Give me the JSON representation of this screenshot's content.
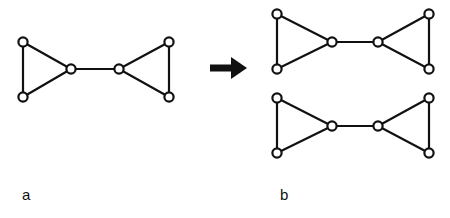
{
  "figure": {
    "width": 450,
    "height": 218,
    "background": "#ffffff",
    "stroke_color": "#111111",
    "node_fill": "#ffffff",
    "panels": [
      {
        "id": "a",
        "label": "a",
        "label_x": 22,
        "label_y": 200,
        "caption": "bowtie graph before split"
      },
      {
        "id": "b",
        "label": "b",
        "label_x": 280,
        "label_y": 200,
        "caption": "two bowtie graphs after split"
      }
    ],
    "arrow": {
      "name": "rightwards-arrow",
      "shaft_x1": 210,
      "shaft_x2": 233,
      "y": 68,
      "shaft_height": 7,
      "head_x": 247,
      "head_half_height": 11
    },
    "graphs": [
      {
        "id": "graph-a",
        "panel": "a",
        "node_radius": 4.6,
        "nodes": [
          {
            "id": "a-tl",
            "name": "node-top-left",
            "x": 23,
            "y": 42
          },
          {
            "id": "a-bl",
            "name": "node-bottom-left",
            "x": 23,
            "y": 97
          },
          {
            "id": "a-ml",
            "name": "node-middle-left",
            "x": 71,
            "y": 69
          },
          {
            "id": "a-mr",
            "name": "node-middle-right",
            "x": 119,
            "y": 69
          },
          {
            "id": "a-tr",
            "name": "node-top-right",
            "x": 169,
            "y": 42
          },
          {
            "id": "a-br",
            "name": "node-bottom-right",
            "x": 169,
            "y": 97
          }
        ],
        "edges": [
          {
            "from": "a-tl",
            "to": "a-bl",
            "name": "edge-left-vertical"
          },
          {
            "from": "a-tl",
            "to": "a-ml",
            "name": "edge-top-left-diagonal"
          },
          {
            "from": "a-bl",
            "to": "a-ml",
            "name": "edge-bottom-left-diagonal"
          },
          {
            "from": "a-ml",
            "to": "a-mr",
            "name": "edge-bridge"
          },
          {
            "from": "a-mr",
            "to": "a-tr",
            "name": "edge-top-right-diagonal"
          },
          {
            "from": "a-mr",
            "to": "a-br",
            "name": "edge-bottom-right-diagonal"
          },
          {
            "from": "a-tr",
            "to": "a-br",
            "name": "edge-right-vertical"
          }
        ]
      },
      {
        "id": "graph-b-top",
        "panel": "b",
        "node_radius": 4.6,
        "nodes": [
          {
            "id": "bt-tl",
            "name": "node-top-left",
            "x": 277,
            "y": 14
          },
          {
            "id": "bt-bl",
            "name": "node-bottom-left",
            "x": 277,
            "y": 69
          },
          {
            "id": "bt-ml",
            "name": "node-middle-left",
            "x": 332,
            "y": 42
          },
          {
            "id": "bt-mr",
            "name": "node-middle-right",
            "x": 378,
            "y": 42
          },
          {
            "id": "bt-tr",
            "name": "node-top-right",
            "x": 429,
            "y": 14
          },
          {
            "id": "bt-br",
            "name": "node-bottom-right",
            "x": 429,
            "y": 69
          }
        ],
        "edges": [
          {
            "from": "bt-tl",
            "to": "bt-bl",
            "name": "edge-left-vertical"
          },
          {
            "from": "bt-tl",
            "to": "bt-ml",
            "name": "edge-top-left-diagonal"
          },
          {
            "from": "bt-bl",
            "to": "bt-ml",
            "name": "edge-bottom-left-diagonal"
          },
          {
            "from": "bt-ml",
            "to": "bt-mr",
            "name": "edge-bridge"
          },
          {
            "from": "bt-mr",
            "to": "bt-tr",
            "name": "edge-top-right-diagonal"
          },
          {
            "from": "bt-mr",
            "to": "bt-br",
            "name": "edge-bottom-right-diagonal"
          },
          {
            "from": "bt-tr",
            "to": "bt-br",
            "name": "edge-right-vertical"
          }
        ]
      },
      {
        "id": "graph-b-bottom",
        "panel": "b",
        "node_radius": 4.6,
        "nodes": [
          {
            "id": "bb-tl",
            "name": "node-top-left",
            "x": 277,
            "y": 98
          },
          {
            "id": "bb-bl",
            "name": "node-bottom-left",
            "x": 277,
            "y": 153
          },
          {
            "id": "bb-ml",
            "name": "node-middle-left",
            "x": 332,
            "y": 126
          },
          {
            "id": "bb-mr",
            "name": "node-middle-right",
            "x": 378,
            "y": 126
          },
          {
            "id": "bb-tr",
            "name": "node-top-right",
            "x": 429,
            "y": 98
          },
          {
            "id": "bb-br",
            "name": "node-bottom-right",
            "x": 429,
            "y": 153
          }
        ],
        "edges": [
          {
            "from": "bb-tl",
            "to": "bb-bl",
            "name": "edge-left-vertical"
          },
          {
            "from": "bb-tl",
            "to": "bb-ml",
            "name": "edge-top-left-diagonal"
          },
          {
            "from": "bb-bl",
            "to": "bb-ml",
            "name": "edge-bottom-left-diagonal"
          },
          {
            "from": "bb-ml",
            "to": "bb-mr",
            "name": "edge-bridge"
          },
          {
            "from": "bb-mr",
            "to": "bb-tr",
            "name": "edge-top-right-diagonal"
          },
          {
            "from": "bb-mr",
            "to": "bb-br",
            "name": "edge-bottom-right-diagonal"
          },
          {
            "from": "bb-tr",
            "to": "bb-br",
            "name": "edge-right-vertical"
          }
        ]
      }
    ]
  }
}
